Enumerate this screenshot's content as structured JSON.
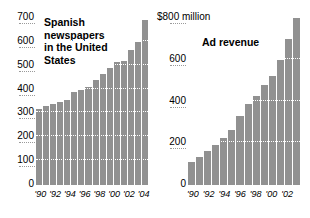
{
  "chart_data": [
    {
      "type": "bar",
      "title": "Spanish\nnewspapers\nin the United\nStates",
      "xlabel": "",
      "ylabel": "",
      "ylim": [
        0,
        700
      ],
      "yticks": [
        0,
        100,
        200,
        300,
        400,
        500,
        600,
        700
      ],
      "ytick_labels": [
        "0",
        "100",
        "200",
        "300",
        "400",
        "500",
        "600",
        "700"
      ],
      "grid": true,
      "xtick_labels": [
        "'90",
        "'92",
        "'94",
        "'96",
        "'98",
        "'00",
        "'02",
        "'04"
      ],
      "categories": [
        "1990",
        "1991",
        "1992",
        "1993",
        "1994",
        "1995",
        "1996",
        "1997",
        "1998",
        "1999",
        "2000",
        "2001",
        "2002",
        "2003",
        "2004",
        "2005"
      ],
      "values": [
        320,
        330,
        340,
        350,
        355,
        390,
        400,
        410,
        440,
        465,
        490,
        515,
        520,
        565,
        600,
        690
      ],
      "bar_color": "#919191"
    },
    {
      "type": "bar",
      "title": "Ad revenue",
      "xlabel": "",
      "ylabel": "",
      "ylim": [
        0,
        800
      ],
      "yticks": [
        0,
        200,
        400,
        600,
        800
      ],
      "ytick_labels": [
        "0",
        "200",
        "400",
        "600",
        "$800 million"
      ],
      "grid": true,
      "xtick_labels": [
        "'90",
        "'92",
        "'94",
        "'96",
        "'98",
        "'00",
        "'02"
      ],
      "categories": [
        "1990",
        "1991",
        "1992",
        "1993",
        "1994",
        "1995",
        "1996",
        "1997",
        "1998",
        "1999",
        "2000",
        "2001",
        "2002",
        "2003"
      ],
      "values": [
        110,
        135,
        165,
        190,
        225,
        265,
        330,
        390,
        425,
        480,
        520,
        600,
        700,
        800
      ],
      "bar_color": "#919191"
    }
  ]
}
